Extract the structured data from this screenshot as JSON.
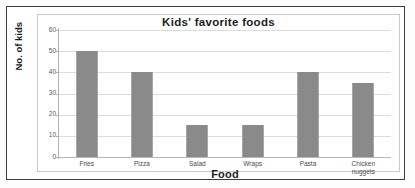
{
  "chart_data": {
    "type": "bar",
    "title": "Kids' favorite foods",
    "xlabel": "Food",
    "ylabel": "No. of kids",
    "categories": [
      "Fries",
      "Pizza",
      "Salad",
      "Wraps",
      "Pasta",
      "Chicken nuggets"
    ],
    "category_lines": [
      [
        "Fries"
      ],
      [
        "Pizza"
      ],
      [
        "Salad"
      ],
      [
        "Wraps"
      ],
      [
        "Pasta"
      ],
      [
        "Chicken",
        "nuggets"
      ]
    ],
    "values": [
      50,
      40,
      15,
      15,
      40,
      35
    ],
    "ylim": [
      0,
      60
    ],
    "yticks": [
      0,
      10,
      20,
      30,
      40,
      50,
      60
    ],
    "ytick_labels": [
      "0",
      "10",
      "20",
      "30",
      "40",
      "50",
      "60"
    ],
    "grid": true,
    "legend": false,
    "bar_color": "#8a8a8a",
    "gridline_color": "#dcdcdc",
    "axis_color": "#b0b0b0",
    "text_color": "#1d1d1d"
  }
}
